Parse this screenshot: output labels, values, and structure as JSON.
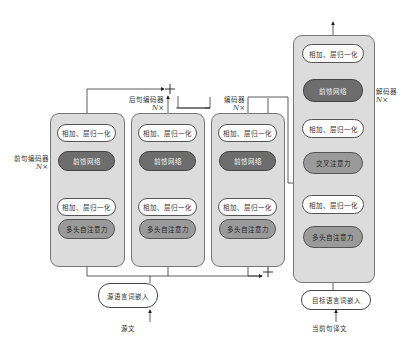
{
  "diagram": {
    "blocks": [
      {
        "id": "prev-encoder",
        "label": "前句编码器",
        "repeat": "N×",
        "layers": [
          {
            "type": "norm",
            "label": "相加、层归一化"
          },
          {
            "type": "ffn",
            "label": "前馈网络"
          },
          {
            "type": "norm",
            "label": "相加、层归一化"
          },
          {
            "type": "attn",
            "label": "多头自注意力"
          }
        ]
      },
      {
        "id": "next-encoder",
        "label": "后句编码器",
        "repeat": "N×",
        "layers": [
          {
            "type": "norm",
            "label": "相加、层归一化"
          },
          {
            "type": "ffn",
            "label": "前馈网络"
          },
          {
            "type": "norm",
            "label": "相加、层归一化"
          },
          {
            "type": "attn",
            "label": "多头自注意力"
          }
        ]
      },
      {
        "id": "encoder",
        "label": "编码器",
        "repeat": "N×",
        "layers": [
          {
            "type": "norm",
            "label": "相加、层归一化"
          },
          {
            "type": "ffn",
            "label": "前馈网络"
          },
          {
            "type": "norm",
            "label": "相加、层归一化"
          },
          {
            "type": "attn",
            "label": "多头自注意力"
          }
        ]
      },
      {
        "id": "decoder",
        "label": "解码器",
        "repeat": "N×",
        "layers": [
          {
            "type": "norm",
            "label": "相加、层归一化"
          },
          {
            "type": "ffn",
            "label": "前馈网络"
          },
          {
            "type": "norm",
            "label": "相加、层归一化"
          },
          {
            "type": "attn",
            "label": "交叉注意力"
          },
          {
            "type": "norm",
            "label": "相加、层归一化"
          },
          {
            "type": "attn",
            "label": "多头自注意力"
          }
        ]
      }
    ],
    "source_embedding": "源语言词嵌入",
    "target_embedding": "目标语言词嵌入",
    "source_input": "源文",
    "target_input": "当前句译文",
    "plus_symbol": "+",
    "colors": {
      "block_fill": "#dcdcdc",
      "norm_fill": "#fdfdfd",
      "ffn_fill": "#6d6d6d",
      "attn_fill": "#9a9a9a",
      "line": "#333333"
    }
  },
  "caption": {
    "text": ""
  }
}
